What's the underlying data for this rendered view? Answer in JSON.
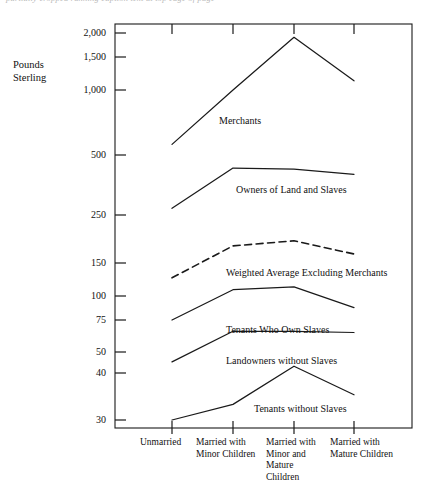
{
  "caption": {
    "text": "partially cropped running caption text at top edge of page"
  },
  "chart_data": {
    "type": "line",
    "title": "",
    "xlabel": "",
    "ylabel": "Pounds\nSterling",
    "yscale": "log",
    "ylim": [
      28,
      2200
    ],
    "grid": false,
    "legend_position": "inline-labels",
    "categories": [
      "Unmarried",
      "Married with\nMinor Children",
      "Married with\nMinor and\nMature\nChildren",
      "Married with\nMature Children"
    ],
    "ytick_labels": [
      "2,000",
      "1,500",
      "1,000",
      "500",
      "250",
      "150",
      "100",
      "75",
      "50",
      "40",
      "30"
    ],
    "ytick_values": [
      2000,
      1500,
      1000,
      500,
      250,
      150,
      100,
      75,
      50,
      40,
      30
    ],
    "series": [
      {
        "name": "Merchants",
        "style": "solid",
        "values": [
          560,
          1000,
          1900,
          1120
        ],
        "label_x": 294,
        "label_y": 121
      },
      {
        "name": "Owners of Land and Slaves",
        "style": "solid",
        "values": [
          270,
          430,
          425,
          400
        ],
        "label_x": 233,
        "label_y": 190
      },
      {
        "name": "Weighted Average Excluding Merchants",
        "style": "dashed",
        "values": [
          125,
          180,
          190,
          165
        ],
        "label_x": 233,
        "label_y": 273
      },
      {
        "name": "Tenants Who Own Slaves",
        "style": "solid",
        "values": [
          75,
          108,
          112,
          87
        ],
        "label_x": 233,
        "label_y": 329
      },
      {
        "name": "Landowners without Slaves",
        "style": "solid",
        "values": [
          45,
          65,
          65,
          64
        ],
        "label_x": 233,
        "label_y": 360
      },
      {
        "name": "Tenants without Slaves",
        "style": "solid",
        "values": [
          30,
          33,
          43,
          35
        ],
        "label_x": 261,
        "label_y": 408
      }
    ]
  },
  "plot_geometry": {
    "left": 115,
    "right": 412,
    "top": 24,
    "bottom": 428,
    "category_x": [
      172,
      233,
      294,
      354
    ],
    "ytick_y": [
      33,
      57,
      90,
      155,
      215,
      263,
      296,
      320,
      352,
      373,
      420
    ]
  }
}
